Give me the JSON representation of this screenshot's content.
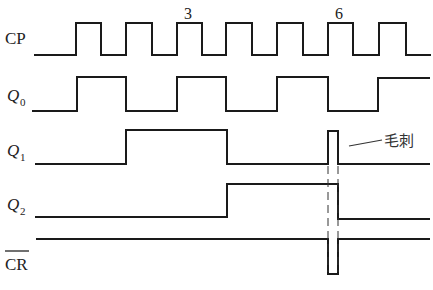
{
  "diagram": {
    "type": "timing-diagram",
    "signals": [
      {
        "id": "cp",
        "label": "CP",
        "subscript": "",
        "overbar": false,
        "points": "34,55 76,55 76,23 101,23 101,55 126,55 126,23 152,23 152,55 177,55 177,23 202,23 202,55 226,55 226,23 252,23 252,55 277,55 277,23 303,23 303,55 328,55 328,23 353,23 353,55 379,55 379,23 406,23 406,55 431,55"
      },
      {
        "id": "q0",
        "label": "Q",
        "subscript": "0",
        "overbar": false,
        "points": "32,111 77,111 77,77 126,77 126,111 177,111 177,77 226,77 226,111 277,111 277,77 328,77 328,111 378,111 378,78 430,78"
      },
      {
        "id": "q1",
        "label": "Q",
        "subscript": "1",
        "overbar": false,
        "points": "35,164 126,164 126,130 227,130 227,164 328,164 328,131 338,131 338,164 430,164"
      },
      {
        "id": "q2",
        "label": "Q",
        "subscript": "2",
        "overbar": false,
        "points": "35,217 227,217 227,184 338,184 338,219 430,219"
      },
      {
        "id": "cr",
        "label": "CR",
        "subscript": "",
        "overbar": true,
        "points": "36,239 328,239 328,274 338,274 338,239 430,239"
      }
    ],
    "pulse_markers": [
      {
        "text": "3",
        "x": 188,
        "y": 19
      },
      {
        "text": "6",
        "x": 339,
        "y": 19
      }
    ],
    "annotation": {
      "text": "毛刺",
      "meaning": "glitch"
    }
  }
}
